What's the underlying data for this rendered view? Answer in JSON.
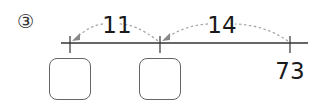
{
  "problem": {
    "index_label": "③"
  },
  "number_line": {
    "jumps": [
      {
        "label": "11",
        "from_tick": 1,
        "to_tick": 0
      },
      {
        "label": "14",
        "from_tick": 2,
        "to_tick": 1
      }
    ],
    "ticks": [
      {
        "value": "",
        "is_blank": true
      },
      {
        "value": "",
        "is_blank": true
      },
      {
        "value": "73",
        "is_blank": false
      }
    ]
  },
  "colors": {
    "line": "#333333",
    "dashed_arc": "#aaaaaa",
    "box_border": "#666666",
    "text": "#1a1a1a"
  }
}
